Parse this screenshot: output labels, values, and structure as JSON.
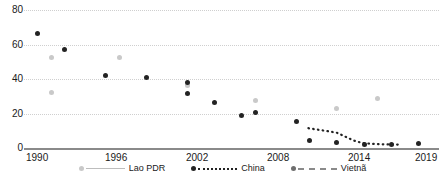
{
  "chart_data": {
    "type": "scatter",
    "title": "",
    "xlabel": "",
    "ylabel": "",
    "xlim": [
      1989,
      2019.5
    ],
    "ylim": [
      0,
      80
    ],
    "yticks": [
      0,
      20,
      40,
      60,
      80
    ],
    "xticks": [
      1990,
      1996,
      2002,
      2008,
      2014,
      2019
    ],
    "grid": true,
    "legend_position": "bottom-center",
    "series": [
      {
        "name": "Lao PDR",
        "color": "#c9c9c9",
        "marker": "circle",
        "line_style": "solid",
        "points": [
          {
            "x": 1991,
            "y": 52.5
          },
          {
            "x": 1991,
            "y": 32.0
          },
          {
            "x": 1996,
            "y": 52.5
          },
          {
            "x": 2001,
            "y": 36.0
          },
          {
            "x": 2006,
            "y": 27.5
          },
          {
            "x": 2012,
            "y": 23.0
          },
          {
            "x": 2015,
            "y": 28.5
          }
        ]
      },
      {
        "name": "China",
        "color": "#232323",
        "marker": "circle",
        "line_style": "dotted",
        "points": [
          {
            "x": 1990,
            "y": 66.5
          },
          {
            "x": 1992,
            "y": 57.0
          },
          {
            "x": 1995,
            "y": 42.0
          },
          {
            "x": 1998,
            "y": 41.0
          },
          {
            "x": 2001,
            "y": 38.0
          },
          {
            "x": 2001,
            "y": 31.5
          },
          {
            "x": 2003,
            "y": 26.5
          },
          {
            "x": 2005,
            "y": 19.0
          },
          {
            "x": 2006,
            "y": 20.5
          },
          {
            "x": 2009,
            "y": 15.5
          },
          {
            "x": 2010,
            "y": 4.5
          },
          {
            "x": 2012,
            "y": 3.0
          },
          {
            "x": 2014,
            "y": 2.0
          },
          {
            "x": 2016,
            "y": 2.0
          },
          {
            "x": 2018,
            "y": 2.5
          }
        ],
        "trend_line": [
          {
            "x": 2009.9,
            "y": 11.5
          },
          {
            "x": 2010.6,
            "y": 10.6
          },
          {
            "x": 2011.3,
            "y": 9.8
          },
          {
            "x": 2012.0,
            "y": 8.8
          },
          {
            "x": 2012.6,
            "y": 6.6
          },
          {
            "x": 2013.2,
            "y": 4.4
          },
          {
            "x": 2013.8,
            "y": 3.0
          },
          {
            "x": 2014.6,
            "y": 2.4
          },
          {
            "x": 2015.6,
            "y": 2.1
          },
          {
            "x": 2016.6,
            "y": 2.0
          }
        ]
      },
      {
        "name": "Vietnã",
        "color": "#6e6e6e",
        "marker": "circle",
        "line_style": "dashed",
        "points": []
      }
    ]
  },
  "axis": {
    "y_labels": [
      "0",
      "20",
      "40",
      "60",
      "80"
    ],
    "x_labels": [
      "1990",
      "1996",
      "2002",
      "2008",
      "2014",
      "2019"
    ]
  },
  "legend": {
    "items": [
      {
        "label": "Lao PDR",
        "color": "#c9c9c9",
        "style": "solid"
      },
      {
        "label": "China",
        "color": "#232323",
        "style": "dotted"
      },
      {
        "label": "Vietnã",
        "color": "#6e6e6e",
        "style": "dashed"
      }
    ]
  }
}
